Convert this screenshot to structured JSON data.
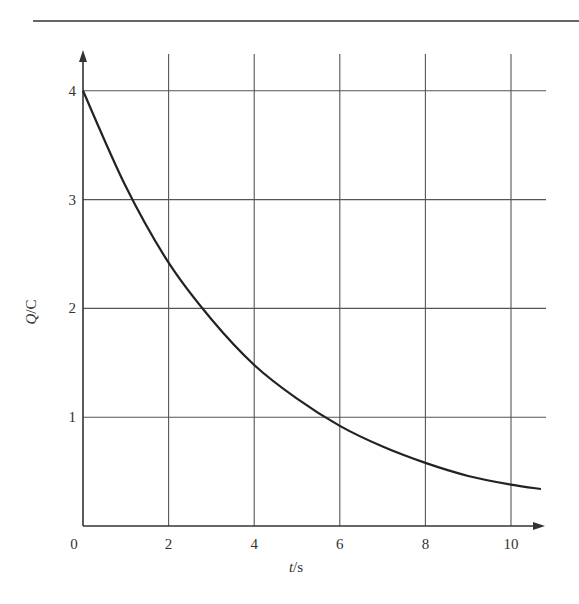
{
  "chart_data": {
    "type": "line",
    "title": "",
    "xlabel": "t/s",
    "ylabel": "Q/C",
    "xlabel_parts": {
      "var": "t",
      "unit": "/s"
    },
    "ylabel_parts": {
      "var": "Q",
      "unit": "/C"
    },
    "xlim": [
      0,
      10.7
    ],
    "ylim": [
      0,
      4.3
    ],
    "x_ticks": [
      0,
      2,
      4,
      6,
      8,
      10
    ],
    "y_ticks": [
      1,
      2,
      3,
      4
    ],
    "x_tick_labels": [
      "0",
      "2",
      "4",
      "6",
      "8",
      "10"
    ],
    "y_tick_labels": [
      "1",
      "2",
      "3",
      "4"
    ],
    "grid": true,
    "legend": null,
    "series": [
      {
        "name": "Q",
        "x": [
          0,
          1,
          2,
          3,
          4,
          5,
          6,
          7,
          8,
          9,
          10,
          10.7
        ],
        "y": [
          4.0,
          3.12,
          2.42,
          1.9,
          1.48,
          1.17,
          0.92,
          0.73,
          0.58,
          0.46,
          0.38,
          0.34
        ]
      }
    ]
  }
}
